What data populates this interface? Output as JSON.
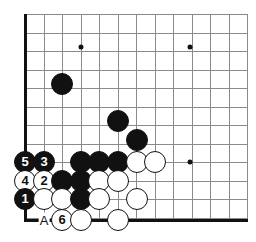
{
  "diagram": {
    "kind": "go-board-corner-diagram",
    "title": "",
    "board": {
      "origin_x": 25,
      "origin_y": 14,
      "spacing": 18.5,
      "cols": 13,
      "rows": 12,
      "left_edge_x": 25,
      "bottom_edge_y": 220,
      "grid_color": "#8a8a8a",
      "edge_color": "#111111"
    },
    "star_points": [
      {
        "x": 81,
        "y": 47
      },
      {
        "x": 190,
        "y": 47
      },
      {
        "x": 190,
        "y": 162
      }
    ],
    "stones": [
      {
        "color": "black",
        "x": 62,
        "y": 84,
        "label": ""
      },
      {
        "color": "black",
        "x": 118,
        "y": 121,
        "label": ""
      },
      {
        "color": "black",
        "x": 137,
        "y": 140,
        "label": ""
      },
      {
        "color": "black",
        "x": 25,
        "y": 162,
        "label": "5"
      },
      {
        "color": "black",
        "x": 44,
        "y": 162,
        "label": "3"
      },
      {
        "color": "black",
        "x": 81,
        "y": 162,
        "label": ""
      },
      {
        "color": "black",
        "x": 99,
        "y": 162,
        "label": ""
      },
      {
        "color": "black",
        "x": 118,
        "y": 162,
        "label": ""
      },
      {
        "color": "white",
        "x": 137,
        "y": 162,
        "label": ""
      },
      {
        "color": "white",
        "x": 155,
        "y": 162,
        "label": ""
      },
      {
        "color": "white",
        "x": 25,
        "y": 181,
        "label": "4"
      },
      {
        "color": "white",
        "x": 44,
        "y": 181,
        "label": "2"
      },
      {
        "color": "black",
        "x": 62,
        "y": 181,
        "label": ""
      },
      {
        "color": "black",
        "x": 81,
        "y": 181,
        "label": ""
      },
      {
        "color": "white",
        "x": 99,
        "y": 181,
        "label": ""
      },
      {
        "color": "white",
        "x": 118,
        "y": 181,
        "label": ""
      },
      {
        "color": "black",
        "x": 25,
        "y": 199,
        "label": "1"
      },
      {
        "color": "white",
        "x": 44,
        "y": 199,
        "label": ""
      },
      {
        "color": "white",
        "x": 62,
        "y": 199,
        "label": ""
      },
      {
        "color": "black",
        "x": 81,
        "y": 199,
        "label": ""
      },
      {
        "color": "white",
        "x": 99,
        "y": 199,
        "label": ""
      },
      {
        "color": "white",
        "x": 137,
        "y": 199,
        "label": ""
      },
      {
        "color": "white",
        "x": 62,
        "y": 220,
        "label": "6"
      },
      {
        "color": "white",
        "x": 81,
        "y": 220,
        "label": ""
      },
      {
        "color": "white",
        "x": 118,
        "y": 220,
        "label": ""
      }
    ],
    "point_labels": [
      {
        "text": "A",
        "x": 44,
        "y": 220
      }
    ]
  }
}
